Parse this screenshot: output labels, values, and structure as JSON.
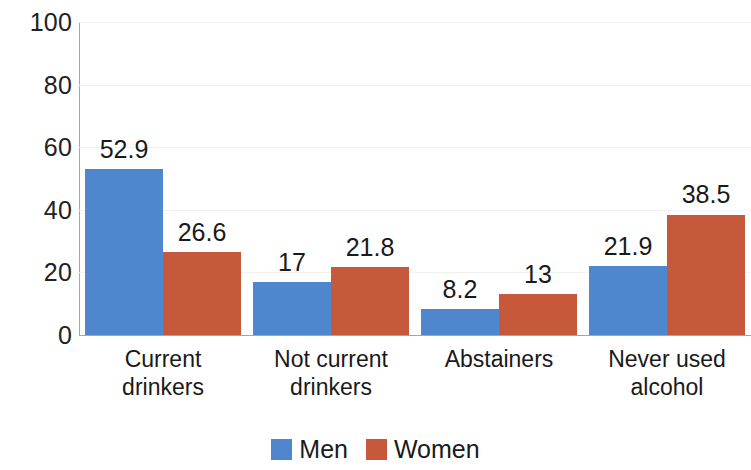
{
  "chart_data": {
    "type": "bar",
    "title": "",
    "subtitle": "",
    "xlabel": "",
    "ylabel": "",
    "categories": [
      "Current\ndrinkers",
      "Not current\ndrinkers",
      "Abstainers",
      "Never used\nalcohol"
    ],
    "series": [
      {
        "name": "Men",
        "color": "#4E87CE",
        "values": [
          52.9,
          17,
          8.2,
          21.9
        ],
        "labels": [
          "52.9",
          "17",
          "8.2",
          "21.9"
        ]
      },
      {
        "name": "Women",
        "color": "#C5593A",
        "values": [
          26.6,
          21.8,
          13,
          38.5
        ],
        "labels": [
          "26.6",
          "21.8",
          "13",
          "38.5"
        ]
      }
    ],
    "ylim": [
      0,
      100
    ],
    "yticks": [
      100,
      80,
      60,
      40,
      20,
      0
    ],
    "ytick_labels": [
      "100",
      "80",
      "60",
      "40",
      "20",
      "0"
    ],
    "grid": true,
    "grid_axis": "y",
    "legend": {
      "position": "bottom",
      "entries": [
        "Men",
        "Women"
      ]
    },
    "data_labels": true
  },
  "axis": {
    "y_ticks": [
      {
        "label": "100",
        "value": 100
      },
      {
        "label": "80",
        "value": 80
      },
      {
        "label": "60",
        "value": 60
      },
      {
        "label": "40",
        "value": 40
      },
      {
        "label": "20",
        "value": 20
      },
      {
        "label": "0",
        "value": 0
      }
    ]
  },
  "categories": [
    {
      "line1": "Current",
      "line2": "drinkers"
    },
    {
      "line1": "Not current",
      "line2": "drinkers"
    },
    {
      "line1": "Abstainers",
      "line2": ""
    },
    {
      "line1": "Never used",
      "line2": "alcohol"
    }
  ],
  "legend": {
    "items": [
      {
        "label": "Men",
        "color": "#4E87CE",
        "swatch": "men-swatch"
      },
      {
        "label": "Women",
        "color": "#C5593A",
        "swatch": "women-swatch"
      }
    ]
  },
  "colors": {
    "men": "#4E87CE",
    "women": "#C5593A",
    "axis": "#A6A6A6",
    "gridline": "#F2F2F2",
    "text": "#1A1A1A",
    "background": "#FFFFFF"
  }
}
